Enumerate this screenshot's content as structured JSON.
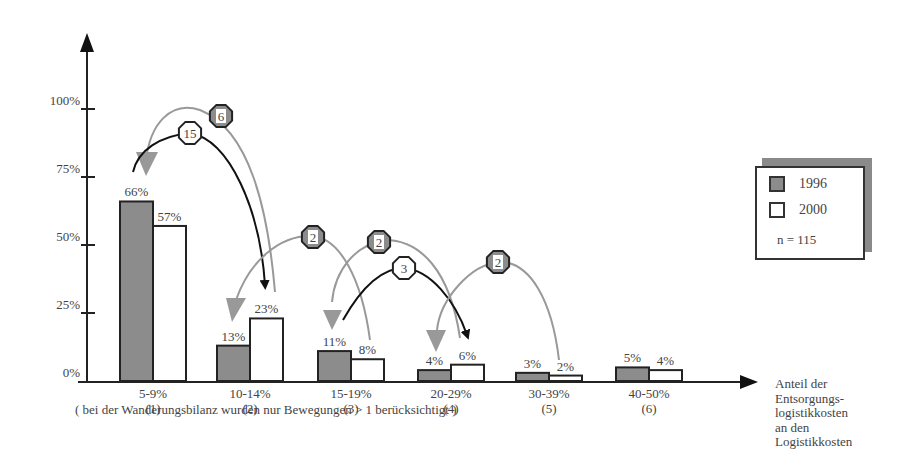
{
  "chart_data": {
    "type": "bar",
    "title": "",
    "xlabel": "Anteil der Entsorgungs-logistikkosten an den Logistikkosten",
    "ylabel": "",
    "ylim": [
      0,
      100
    ],
    "yticks": [
      "0%",
      "25%",
      "50%",
      "75%",
      "100%"
    ],
    "categories": [
      "5-9%\n(1)",
      "10-14%\n(2)",
      "15-19%\n(3)",
      "20-29%\n(4)",
      "30-39%\n(5)",
      "40-50%\n(6)"
    ],
    "category_ranges": [
      "5-9%",
      "10-14%",
      "15-19%",
      "20-29%",
      "30-39%",
      "40-50%"
    ],
    "category_ids": [
      "(1)",
      "(2)",
      "(3)",
      "(4)",
      "(5)",
      "(6)"
    ],
    "series": [
      {
        "name": "1996",
        "color": "#8c8c8c",
        "values": [
          66,
          13,
          11,
          4,
          3,
          5
        ],
        "labels": [
          "66%",
          "13%",
          "11%",
          "4%",
          "3%",
          "5%"
        ]
      },
      {
        "name": "2000",
        "color": "#ffffff",
        "values": [
          57,
          23,
          8,
          6,
          2,
          4
        ],
        "labels": [
          "57%",
          "23%",
          "8%",
          "6%",
          "2%",
          "4%"
        ]
      }
    ],
    "legend_position": "right",
    "grid": false,
    "annotations": {
      "sample_size": "n = 115",
      "footnote": "( bei der Wanderungsbilanz wurden nur Bewegungen > 1 berücksichtigt )",
      "migration_flows": [
        {
          "from": "(2)",
          "to": "(1)",
          "count": "6",
          "style": "gray"
        },
        {
          "from": "(1)",
          "to": "(2)",
          "count": "15",
          "style": "black"
        },
        {
          "from": "(3)",
          "to": "(2)",
          "count": "2",
          "style": "gray"
        },
        {
          "from": "(4)",
          "to": "(3)",
          "count": "2",
          "style": "gray"
        },
        {
          "from": "(3)",
          "to": "(4)",
          "count": "3",
          "style": "black"
        },
        {
          "from": "(5)",
          "to": "(4)",
          "count": "2",
          "style": "gray"
        }
      ]
    }
  },
  "legend": {
    "items": [
      {
        "label": "1996"
      },
      {
        "label": "2000"
      }
    ],
    "n": "n = 115"
  },
  "axis": {
    "x_title_lines": [
      "Anteil der",
      "Entsorgungs-",
      "logistikkosten",
      "an den",
      "Logistikkosten"
    ]
  },
  "footnote": "( bei der Wanderungsbilanz wurden nur Bewegungen > 1 berücksichtigt )"
}
